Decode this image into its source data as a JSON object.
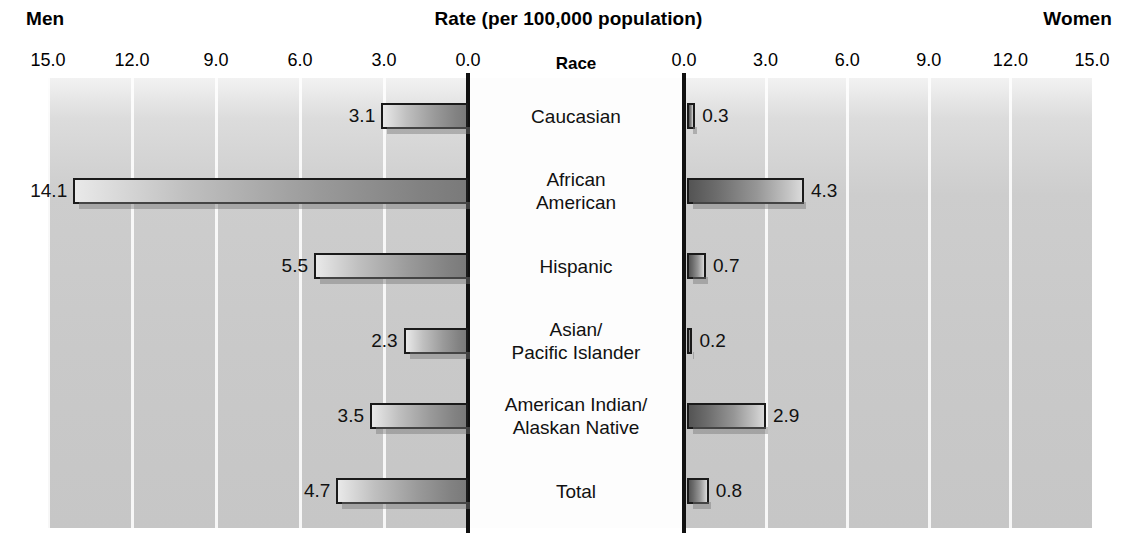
{
  "header": {
    "left_label": "Men",
    "right_label": "Women",
    "title": "Rate (per 100,000 population)",
    "category_header": "Race"
  },
  "axis": {
    "left_ticks": [
      "15.0",
      "12.0",
      "9.0",
      "6.0",
      "3.0",
      "0.0"
    ],
    "right_ticks": [
      "0.0",
      "3.0",
      "6.0",
      "9.0",
      "12.0",
      "15.0"
    ]
  },
  "chart_data": {
    "type": "bar",
    "title": "Rate (per 100,000 population)",
    "xlabel": "Rate (per 100,000 population)",
    "ylabel": "Race",
    "orientation": "horizontal",
    "layout": "back-to-back population pyramid",
    "categories": [
      "Caucasian",
      "African American",
      "Hispanic",
      "Asian/ Pacific Islander",
      "American Indian/ Alaskan Native",
      "Total"
    ],
    "series": [
      {
        "name": "Men",
        "side": "left",
        "values": [
          3.1,
          14.1,
          5.5,
          2.3,
          3.5,
          4.7
        ]
      },
      {
        "name": "Women",
        "side": "right",
        "values": [
          0.3,
          4.3,
          0.7,
          0.2,
          2.9,
          0.8
        ]
      }
    ],
    "xlim": [
      0,
      15
    ],
    "ticks": [
      0,
      3,
      6,
      9,
      12,
      15
    ],
    "grid": true,
    "legend": "none"
  },
  "rows": [
    {
      "label_line1": "Caucasian",
      "label_line2": "",
      "men": "3.1",
      "men_value": 3.1,
      "women": "0.3",
      "women_value": 0.3
    },
    {
      "label_line1": "African",
      "label_line2": "American",
      "men": "14.1",
      "men_value": 14.1,
      "women": "4.3",
      "women_value": 4.3
    },
    {
      "label_line1": "Hispanic",
      "label_line2": "",
      "men": "5.5",
      "men_value": 5.5,
      "women": "0.7",
      "women_value": 0.7
    },
    {
      "label_line1": "Asian/",
      "label_line2": "Pacific Islander",
      "men": "2.3",
      "men_value": 2.3,
      "women": "0.2",
      "women_value": 0.2
    },
    {
      "label_line1": "American Indian/",
      "label_line2": "Alaskan Native",
      "men": "3.5",
      "men_value": 3.5,
      "women": "2.9",
      "women_value": 2.9
    },
    {
      "label_line1": "Total",
      "label_line2": "",
      "men": "4.7",
      "men_value": 4.7,
      "women": "0.8",
      "women_value": 0.8
    }
  ],
  "colors": {
    "plot_background": "#c9c9c9",
    "center_background": "#fdfdfd",
    "axis_line": "#111111",
    "gridline": "#ffffff",
    "bar_outline": "#1a1a1a",
    "text": "#000000"
  }
}
